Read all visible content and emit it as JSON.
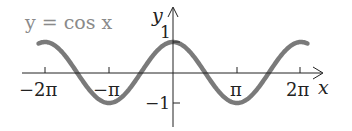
{
  "chart_data": {
    "type": "line",
    "title": "y = cos x",
    "xlabel": "x",
    "ylabel": "y",
    "x_ticks": [
      "−2π",
      "−π",
      "π",
      "2π"
    ],
    "y_ticks": [
      "1",
      "−1"
    ],
    "xlim": [
      -8.0,
      8.2
    ],
    "ylim": [
      -1.3,
      1.5
    ],
    "grid": false,
    "series": [
      {
        "name": "y = cos x",
        "function": "cos(x)",
        "x_range": [
          -6.6,
          6.6
        ],
        "color": "#7a7a7a"
      }
    ],
    "sample_points": [
      {
        "x": -6.283,
        "y": 1
      },
      {
        "x": -4.712,
        "y": 0
      },
      {
        "x": -3.142,
        "y": -1
      },
      {
        "x": -1.571,
        "y": 0
      },
      {
        "x": 0,
        "y": 1
      },
      {
        "x": 1.571,
        "y": 0
      },
      {
        "x": 3.142,
        "y": -1
      },
      {
        "x": 4.712,
        "y": 0
      },
      {
        "x": 6.283,
        "y": 1
      }
    ]
  },
  "labels": {
    "equation": "y = cos x",
    "x_axis": "x",
    "y_axis": "y",
    "tick_neg2pi": "−2π",
    "tick_negpi": "−π",
    "tick_pi": "π",
    "tick_2pi": "2π",
    "tick_1": "1",
    "tick_neg1": "−1"
  },
  "colors": {
    "curve": "#7a7a7a",
    "axis": "#222222",
    "equation": "#8a8a8a"
  }
}
